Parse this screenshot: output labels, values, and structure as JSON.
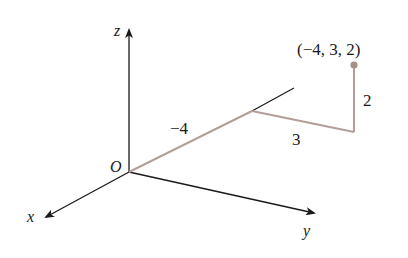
{
  "diagram": {
    "type": "3d-coordinate-axes",
    "axes": {
      "x_label": "x",
      "y_label": "y",
      "z_label": "z",
      "origin_label": "O"
    },
    "point": {
      "label": "(−4, 3, 2)",
      "coordinates": [
        -4,
        3,
        2
      ]
    },
    "path_labels": {
      "x_step": "−4",
      "y_step": "3",
      "z_step": "2"
    },
    "colors": {
      "axis": "#1a1a1a",
      "path": "#b59e9a",
      "point": "#a88f8b"
    }
  }
}
